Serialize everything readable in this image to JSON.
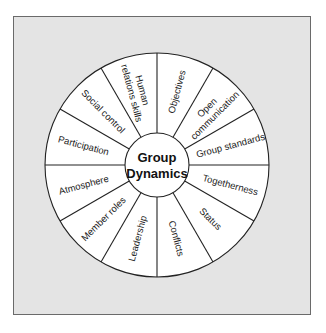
{
  "diagram": {
    "title": "Group Dynamics",
    "center": {
      "line1": "Group",
      "line2": "Dynamics"
    },
    "segments": [
      {
        "label": "Objectives",
        "lines": [
          "Objectives"
        ]
      },
      {
        "label": "Open communication",
        "lines": [
          "Open",
          "communication"
        ]
      },
      {
        "label": "Group standards",
        "lines": [
          "Group standards"
        ]
      },
      {
        "label": "Togetherness",
        "lines": [
          "Togetherness"
        ]
      },
      {
        "label": "Status",
        "lines": [
          "Status"
        ]
      },
      {
        "label": "Conflicts",
        "lines": [
          "Conflicts"
        ]
      },
      {
        "label": "Leadership",
        "lines": [
          "Leadership"
        ]
      },
      {
        "label": "Member roles",
        "lines": [
          "Member roles"
        ]
      },
      {
        "label": "Atmosphere",
        "lines": [
          "Atmosphere"
        ]
      },
      {
        "label": "Participation",
        "lines": [
          "Participation"
        ]
      },
      {
        "label": "Social control",
        "lines": [
          "Social control"
        ]
      },
      {
        "label": "Human relations skills",
        "lines": [
          "Human",
          "relations skills"
        ]
      }
    ],
    "colors": {
      "background": "#e4e4e4",
      "wheel_fill": "#ffffff",
      "stroke": "#222222",
      "frame_border": "#6a6a6a"
    }
  }
}
